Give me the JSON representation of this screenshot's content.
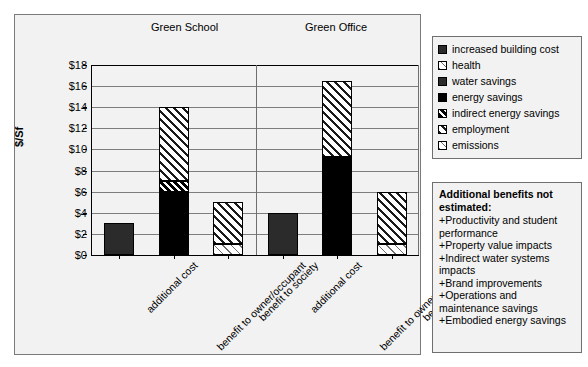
{
  "chart_data": {
    "type": "bar",
    "title": "",
    "xlabel": "",
    "ylabel": "$/Sf",
    "ylim": [
      0,
      18
    ],
    "ytick_labels": [
      "$18",
      "$16",
      "$14",
      "$12",
      "$10",
      "$8",
      "$6",
      "$4",
      "$2",
      "$0"
    ],
    "ytick_values": [
      18,
      16,
      14,
      12,
      10,
      8,
      6,
      4,
      2,
      0
    ],
    "grid": true,
    "stacked": true,
    "legend_position": "right",
    "groups": [
      {
        "name": "Green School",
        "categories": [
          "additional cost",
          "benefit to owner/occupant",
          "benefit to society"
        ]
      },
      {
        "name": "Green Office",
        "categories": [
          "additional cost",
          "benefit to owner/occupant",
          "benefit to society"
        ]
      }
    ],
    "series": [
      {
        "name": "increased building cost",
        "fill": "dark-gray-solid",
        "values": [
          3,
          0,
          0,
          4,
          0,
          0
        ]
      },
      {
        "name": "health",
        "fill": "light-hatch",
        "values": [
          0,
          0,
          0,
          0,
          0,
          0
        ]
      },
      {
        "name": "water savings",
        "fill": "dark-gray-solid",
        "values": [
          0,
          0,
          0,
          0,
          0,
          0
        ]
      },
      {
        "name": "energy savings",
        "fill": "black-solid",
        "values": [
          0,
          6,
          0,
          0,
          9.3,
          0
        ]
      },
      {
        "name": "indirect energy savings",
        "fill": "dark-hatch",
        "values": [
          0,
          1,
          0,
          0,
          0,
          0
        ]
      },
      {
        "name": "employment",
        "fill": "medium-hatch",
        "values": [
          0,
          7,
          4,
          0,
          7.2,
          5
        ]
      },
      {
        "name": "emissions",
        "fill": "light-hatch",
        "values": [
          0,
          0,
          1,
          0,
          0,
          1
        ]
      }
    ],
    "bars": [
      {
        "group": "Green School",
        "category": "additional cost",
        "total": 3,
        "segments": [
          {
            "series": "increased building cost",
            "from": 0,
            "to": 3,
            "fill": "dark-gray-solid"
          }
        ]
      },
      {
        "group": "Green School",
        "category": "benefit to owner/occupant",
        "total": 14,
        "segments": [
          {
            "series": "energy savings",
            "from": 0,
            "to": 6,
            "fill": "black-solid"
          },
          {
            "series": "indirect energy savings",
            "from": 6,
            "to": 7,
            "fill": "dark-hatch"
          },
          {
            "series": "employment",
            "from": 7,
            "to": 14,
            "fill": "medium-hatch"
          }
        ]
      },
      {
        "group": "Green School",
        "category": "benefit to society",
        "total": 5,
        "segments": [
          {
            "series": "emissions",
            "from": 0,
            "to": 1,
            "fill": "light-hatch"
          },
          {
            "series": "employment",
            "from": 1,
            "to": 5,
            "fill": "medium-hatch"
          }
        ]
      },
      {
        "group": "Green Office",
        "category": "additional cost",
        "total": 4,
        "segments": [
          {
            "series": "increased building cost",
            "from": 0,
            "to": 4,
            "fill": "dark-gray-solid"
          }
        ]
      },
      {
        "group": "Green Office",
        "category": "benefit to owner/occupant",
        "total": 16.5,
        "segments": [
          {
            "series": "energy savings",
            "from": 0,
            "to": 9.3,
            "fill": "black-solid"
          },
          {
            "series": "employment",
            "from": 9.3,
            "to": 16.5,
            "fill": "medium-hatch"
          }
        ]
      },
      {
        "group": "Green Office",
        "category": "benefit to society",
        "total": 6,
        "segments": [
          {
            "series": "emissions",
            "from": 0,
            "to": 1,
            "fill": "light-hatch"
          },
          {
            "series": "employment",
            "from": 1,
            "to": 6,
            "fill": "medium-hatch"
          }
        ]
      }
    ]
  },
  "group_titles": {
    "school": "Green School",
    "office": "Green Office"
  },
  "axis": {
    "y_title": "$/Sf",
    "ticks": [
      "$18",
      "$16",
      "$14",
      "$12",
      "$10",
      "$8",
      "$6",
      "$4",
      "$2",
      "$0"
    ]
  },
  "categories": [
    "additional cost",
    "benefit to owner/occupant",
    "benefit to society",
    "additional cost",
    "benefit to owner/occupant",
    "benefit to society"
  ],
  "legend": {
    "items": [
      {
        "label": "increased building cost",
        "fill": "dark-gray-solid"
      },
      {
        "label": "health",
        "fill": "light-hatch"
      },
      {
        "label": "water savings",
        "fill": "dark-gray-solid"
      },
      {
        "label": "energy savings",
        "fill": "black-solid"
      },
      {
        "label": "indirect energy savings",
        "fill": "dark-hatch"
      },
      {
        "label": "employment",
        "fill": "medium-hatch"
      },
      {
        "label": "emissions",
        "fill": "light-hatch"
      }
    ]
  },
  "notes": {
    "title": "Additional benefits not estimated:",
    "items": [
      "+Productivity and student performance",
      "+Property value impacts",
      "+Indirect water systems impacts",
      "+Brand improvements",
      "+Operations and maintenance savings",
      "+Embodied energy savings"
    ]
  },
  "colors": {
    "panel": "#f2f2f2",
    "frame": "#7a7a7a",
    "grid": "#7d7d7d",
    "axis": "#000000",
    "bar_dark_gray": "#2b2b2b",
    "bar_black": "#000000"
  }
}
